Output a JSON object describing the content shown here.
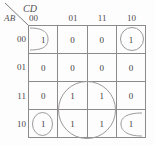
{
  "kmap": {
    "row_axis_label": "AB",
    "col_axis_label": "CD",
    "col_headers": [
      "00",
      "01",
      "11",
      "10"
    ],
    "row_headers": [
      "00",
      "01",
      "11",
      "10"
    ],
    "cells": [
      [
        "1",
        "0",
        "0",
        "1"
      ],
      [
        "0",
        "0",
        "0",
        "0"
      ],
      [
        "0",
        "1",
        "1",
        "0"
      ],
      [
        "1",
        "1",
        "1",
        "1"
      ]
    ],
    "groups": [
      {
        "name": "group-top-left-wrap",
        "shape": "half-oval-open-left"
      },
      {
        "name": "group-top-right",
        "shape": "oval"
      },
      {
        "name": "group-bottom-left-wrap",
        "shape": "oval"
      },
      {
        "name": "group-bottom-right-wrap",
        "shape": "partial-circle-open-right"
      },
      {
        "name": "group-center-quad",
        "shape": "circle"
      }
    ],
    "colors": {
      "grid_line": "#8d8a8b",
      "group_line": "#9c9a9b",
      "text": "#3f3c3d",
      "background": "#fdfdfd"
    }
  }
}
